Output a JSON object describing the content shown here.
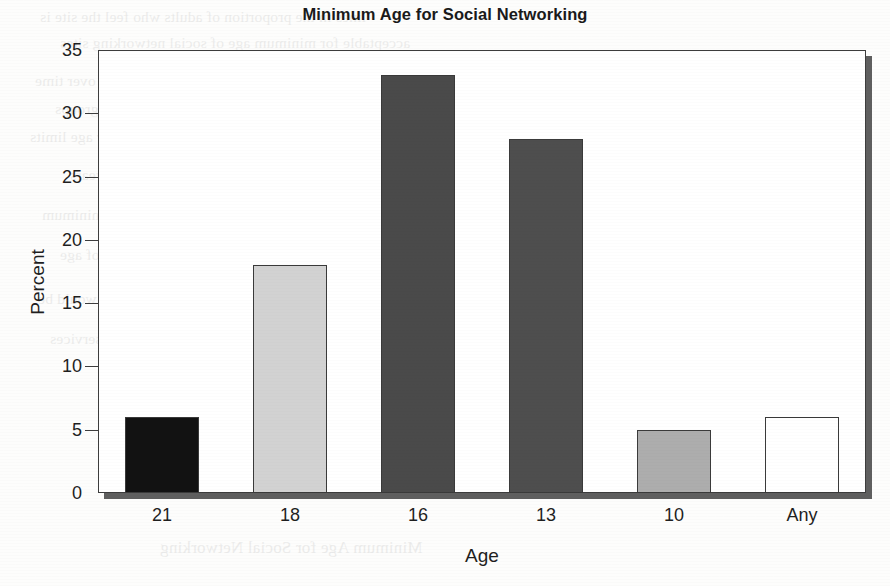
{
  "chart_data": {
    "type": "bar",
    "title": "Minimum Age for Social Networking",
    "xlabel": "Age",
    "ylabel": "Percent",
    "categories": [
      "21",
      "18",
      "16",
      "13",
      "10",
      "Any"
    ],
    "values": [
      6,
      18,
      33,
      28,
      5,
      6
    ],
    "ylim": [
      0,
      35
    ],
    "ytick_labels": [
      "0",
      "5",
      "10",
      "15",
      "20",
      "25",
      "30",
      "35"
    ],
    "ytick_values": [
      0,
      5,
      10,
      15,
      20,
      25,
      30,
      35
    ],
    "grid": false,
    "legend": false,
    "bar_colors": [
      "#121212",
      "#d2d2d2",
      "#4a4a4a",
      "#4e4e4e",
      "#adadad",
      "#ffffff"
    ],
    "bar_edge_color": "#3a3a3a",
    "frame_color": "#3d3d3d",
    "shadow_color": "#5f5f5f",
    "background": "#fdfdfc"
  },
  "page": {
    "bleed_lines": [
      "lines in the proportion of adults who feel the site is",
      "acceptable for minimum age of social networking sites",
      "the survey data remained relatively stable over time",
      "results were consistent across all demographic groups",
      "parents indicated a preference for higher age limits",
      "than the current industry standard of thirteen years",
      "with nearly one third selecting sixteen as the minimum",
      "and a further quarter choosing thirteen years of age",
      "only a small minority reported that any age would be",
      "acceptable for participation in social network services"
    ],
    "bleed_caption": "Minimum Age for Social Networking"
  }
}
